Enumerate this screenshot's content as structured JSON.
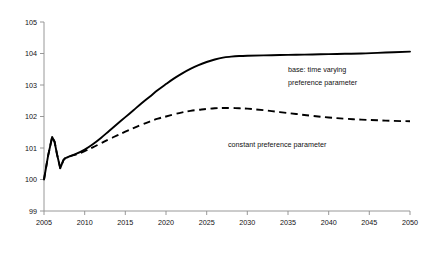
{
  "chart_data": {
    "type": "line",
    "title": "",
    "subtitle": "",
    "xlabel": "",
    "ylabel": "",
    "xlim": [
      2005,
      2050
    ],
    "ylim": [
      99,
      105
    ],
    "grid": false,
    "legend_position": "inline-annotations",
    "x_ticks": [
      "2005",
      "2010",
      "2015",
      "2020",
      "2025",
      "2030",
      "2035",
      "2040",
      "2045",
      "2050"
    ],
    "y_ticks": [
      "99",
      "100",
      "101",
      "102",
      "103",
      "104",
      "105"
    ],
    "x": [
      2005,
      2005.5,
      2006,
      2006.3,
      2006.6,
      2007,
      2007.4,
      2008,
      2009,
      2010,
      2011,
      2012,
      2013,
      2014,
      2015,
      2016,
      2017,
      2018,
      2019,
      2020,
      2021,
      2022,
      2023,
      2024,
      2025,
      2026,
      2027,
      2028,
      2029,
      2030,
      2032,
      2034,
      2036,
      2038,
      2040,
      2042,
      2044,
      2046,
      2048,
      2050
    ],
    "series": [
      {
        "name": "base: time varying preference parameter",
        "style": "solid",
        "color": "#000000",
        "values": [
          100.0,
          100.75,
          101.35,
          101.2,
          100.8,
          100.36,
          100.62,
          100.72,
          100.82,
          100.95,
          101.12,
          101.32,
          101.54,
          101.76,
          101.98,
          102.2,
          102.42,
          102.63,
          102.84,
          103.03,
          103.21,
          103.37,
          103.51,
          103.63,
          103.73,
          103.81,
          103.87,
          103.9,
          103.92,
          103.93,
          103.94,
          103.95,
          103.96,
          103.97,
          103.98,
          103.99,
          104.0,
          104.02,
          104.04,
          104.06
        ]
      },
      {
        "name": "constant preference parameter",
        "style": "dashed",
        "color": "#000000",
        "values": [
          100.0,
          100.75,
          101.35,
          101.2,
          100.8,
          100.36,
          100.62,
          100.72,
          100.8,
          100.9,
          101.02,
          101.15,
          101.28,
          101.4,
          101.52,
          101.63,
          101.74,
          101.84,
          101.93,
          102.0,
          102.07,
          102.13,
          102.18,
          102.21,
          102.24,
          102.26,
          102.27,
          102.27,
          102.26,
          102.25,
          102.2,
          102.14,
          102.08,
          102.02,
          101.97,
          101.93,
          101.9,
          101.88,
          101.86,
          101.85
        ]
      }
    ],
    "annotations": [
      {
        "id": "annotation-base",
        "line1": "base: time varying",
        "line2": "preference parameter",
        "x_px": 288,
        "y_px": 72
      },
      {
        "id": "annotation-constant",
        "line1": "constant preference parameter",
        "line2": "",
        "x_px": 228,
        "y_px": 147
      }
    ]
  },
  "axes": {
    "axis_color": "#8d8d8d",
    "label_color": "#111111"
  }
}
